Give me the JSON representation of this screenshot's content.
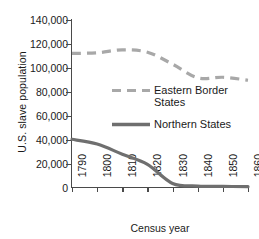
{
  "chart_data": {
    "type": "line",
    "title": "",
    "xlabel": "Census year",
    "ylabel": "U.S. slave population",
    "x": [
      1790,
      1800,
      1810,
      1820,
      1830,
      1840,
      1850,
      1860
    ],
    "xtick_labels": [
      "1790",
      "1800",
      "1810",
      "1820",
      "1830",
      "1840",
      "1850",
      "1860"
    ],
    "ytick_labels": [
      "140,000",
      "120,000",
      "100,000",
      "80,000",
      "60,000",
      "40,000",
      "20,000",
      "0"
    ],
    "ytick_values": [
      140000,
      120000,
      100000,
      80000,
      60000,
      40000,
      20000,
      0
    ],
    "ylim": [
      0,
      140000
    ],
    "xlim": [
      1790,
      1860
    ],
    "grid": false,
    "legend_position": "center-right",
    "series": [
      {
        "name": "Eastern Border States",
        "style": "dashed",
        "color": "#a8a8a8",
        "values": [
          112000,
          112500,
          115000,
          113000,
          103000,
          91500,
          92000,
          89500
        ]
      },
      {
        "name": "Northern States",
        "style": "solid",
        "color": "#6f6f6f",
        "values": [
          40000,
          36000,
          27500,
          19000,
          3000,
          800,
          500,
          300
        ]
      }
    ]
  },
  "legend": {
    "items": [
      {
        "label_line1": "Eastern Border",
        "label_line2": "States"
      },
      {
        "label_line1": "Northern States",
        "label_line2": ""
      }
    ]
  },
  "colors": {
    "eastern_border": "#a8a8a8",
    "northern": "#6f6f6f",
    "axis": "#4a4a4a",
    "text": "#1a1a1a",
    "background": "#ffffff"
  }
}
